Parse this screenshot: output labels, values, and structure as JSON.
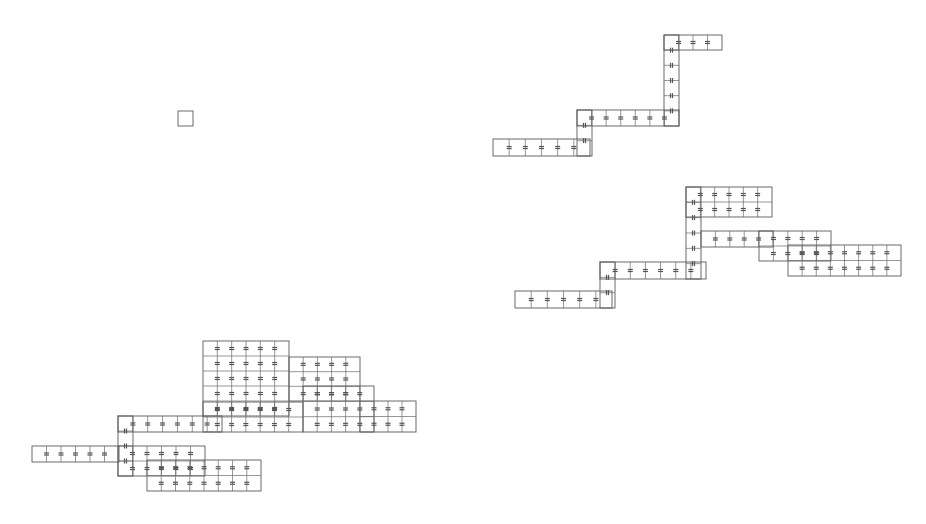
{
  "diagram": {
    "background": "#ffffff",
    "line_color": "#5a5a5a",
    "structures": [
      {
        "name": "single-cell",
        "rects": [
          {
            "x": 178,
            "y": 111,
            "w": 15,
            "h": 15,
            "cols": 1
          }
        ],
        "marks": []
      },
      {
        "name": "top-right-chain",
        "rects": [
          {
            "x": 493,
            "y": 139,
            "w": 97,
            "h": 17,
            "cols": 6,
            "row_marks": true
          },
          {
            "x": 577,
            "y": 110,
            "w": 102,
            "h": 16,
            "cols": 7,
            "row_marks": true
          },
          {
            "x": 577,
            "y": 110,
            "w": 15,
            "h": 46,
            "cols": 1,
            "vert_cells": 3
          },
          {
            "x": 664,
            "y": 35,
            "w": 15,
            "h": 91,
            "cols": 1,
            "vert_cells": 6
          },
          {
            "x": 664,
            "y": 35,
            "w": 58,
            "h": 15,
            "cols": 4,
            "row_marks": true
          }
        ]
      },
      {
        "name": "middle-right-cluster",
        "rects": [
          {
            "x": 515,
            "y": 291,
            "w": 97,
            "h": 17,
            "cols": 6,
            "row_marks": true
          },
          {
            "x": 600,
            "y": 262,
            "w": 106,
            "h": 17,
            "cols": 7,
            "row_marks": true
          },
          {
            "x": 600,
            "y": 262,
            "w": 15,
            "h": 46,
            "cols": 1,
            "vert_cells": 3
          },
          {
            "x": 686,
            "y": 187,
            "w": 15,
            "h": 92,
            "cols": 1,
            "vert_cells": 6
          },
          {
            "x": 686,
            "y": 187,
            "w": 86,
            "h": 30,
            "cols": 6,
            "rows": 2,
            "row_marks": true
          },
          {
            "x": 701,
            "y": 231,
            "w": 72,
            "h": 16,
            "cols": 5,
            "row_marks": true
          },
          {
            "x": 759,
            "y": 231,
            "w": 72,
            "h": 30,
            "cols": 5,
            "rows": 2,
            "row_marks": true
          },
          {
            "x": 788,
            "y": 245,
            "w": 113,
            "h": 31,
            "cols": 8,
            "rows": 2,
            "row_marks": true
          }
        ]
      },
      {
        "name": "bottom-left-cluster",
        "rects": [
          {
            "x": 32,
            "y": 446,
            "w": 87,
            "h": 16,
            "cols": 6,
            "row_marks": true
          },
          {
            "x": 118,
            "y": 416,
            "w": 104,
            "h": 16,
            "cols": 7,
            "row_marks": true
          },
          {
            "x": 118,
            "y": 416,
            "w": 15,
            "h": 60,
            "cols": 1,
            "vert_cells": 4
          },
          {
            "x": 118,
            "y": 446,
            "w": 87,
            "h": 30,
            "cols": 6,
            "rows": 2,
            "row_marks": true
          },
          {
            "x": 147,
            "y": 460,
            "w": 114,
            "h": 31,
            "cols": 8,
            "rows": 2,
            "row_marks": true
          },
          {
            "x": 203,
            "y": 341,
            "w": 86,
            "h": 75,
            "cols": 6,
            "rows": 5,
            "row_marks": true
          },
          {
            "x": 203,
            "y": 402,
            "w": 100,
            "h": 30,
            "cols": 7,
            "rows": 2,
            "row_marks": true
          },
          {
            "x": 289,
            "y": 357,
            "w": 71,
            "h": 44,
            "cols": 5,
            "rows": 3,
            "row_marks": true
          },
          {
            "x": 303,
            "y": 386,
            "w": 71,
            "h": 46,
            "cols": 5,
            "rows": 3,
            "row_marks": true
          },
          {
            "x": 360,
            "y": 401,
            "w": 56,
            "h": 31,
            "cols": 4,
            "rows": 2,
            "row_marks": true
          }
        ]
      }
    ]
  }
}
